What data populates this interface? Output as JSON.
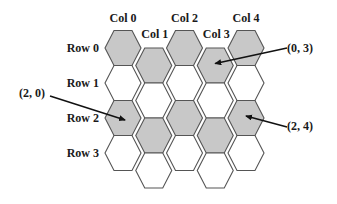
{
  "diagram": {
    "type": "hex-grid-offset-coordinates",
    "layout": "flat-top, odd columns shifted down",
    "columns": [
      "Col 0",
      "Col 1",
      "Col 2",
      "Col 3",
      "Col 4"
    ],
    "rows": [
      "Row 0",
      "Row 1",
      "Row 2",
      "Row 3"
    ],
    "shaded_rows": [
      0,
      2
    ],
    "colors": {
      "shaded_fill": "#c8c8c8",
      "empty_fill": "#ffffff",
      "stroke": "#555555",
      "text": "#1a1a1a",
      "arrow": "#111111"
    },
    "annotations": [
      {
        "label": "(0, 3)",
        "row": 0,
        "col": 3
      },
      {
        "label": "(2, 0)",
        "row": 2,
        "col": 0
      },
      {
        "label": "(2, 4)",
        "row": 2,
        "col": 4
      }
    ]
  }
}
